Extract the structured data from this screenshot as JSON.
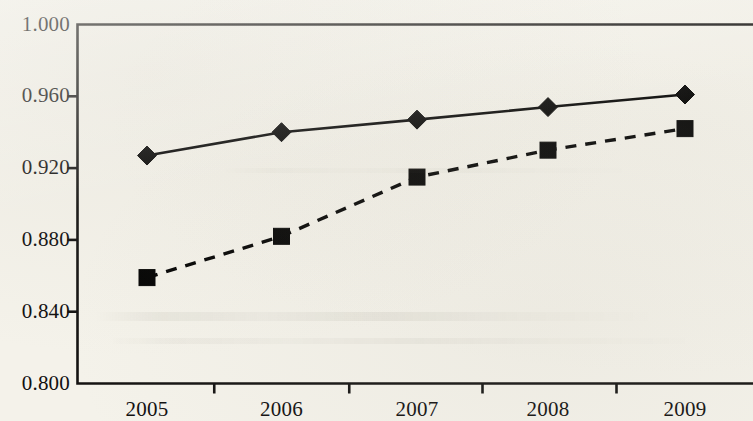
{
  "chart_data": {
    "type": "line",
    "title": "",
    "subtitle": "",
    "xlabel": "",
    "ylabel": "",
    "categories": [
      "2005",
      "2006",
      "2007",
      "2008",
      "2009"
    ],
    "x_tick_labels": [
      "2005",
      "2006",
      "2007",
      "2008",
      "2009"
    ],
    "y_tick_labels": [
      "1.000",
      "0.960",
      "0.920",
      "0.880",
      "0.840",
      "0.800"
    ],
    "y_tick_values": [
      1.0,
      0.96,
      0.92,
      0.88,
      0.84,
      0.8
    ],
    "ylim": [
      0.8,
      1.0
    ],
    "y_tick_step": 0.04,
    "grid": false,
    "legend": false,
    "legend_position": "none",
    "annotations": [],
    "series": [
      {
        "name": "Series 1",
        "marker": "diamond",
        "line_style": "solid",
        "color": "#000000",
        "values": [
          0.927,
          0.94,
          0.947,
          0.954,
          0.961
        ]
      },
      {
        "name": "Series 2",
        "marker": "square",
        "line_style": "dashed",
        "color": "#000000",
        "values": [
          0.859,
          0.882,
          0.915,
          0.93,
          0.942
        ]
      }
    ]
  },
  "colors": {
    "background": "#f4f2ea",
    "ink": "#111010",
    "axis": "#141312"
  }
}
